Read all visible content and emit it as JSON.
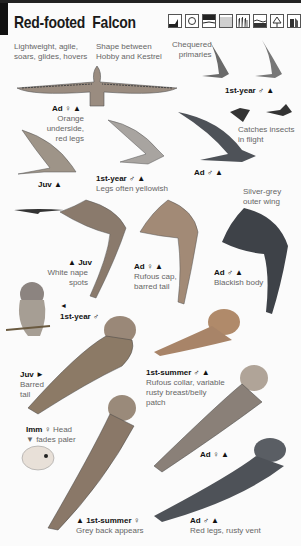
{
  "page": {
    "title": "Red-footed  Falcon",
    "habitat_icons": [
      {
        "name": "coast-icon"
      },
      {
        "name": "scrub-icon"
      },
      {
        "name": "marsh-icon"
      },
      {
        "name": "farmland-icon"
      },
      {
        "name": "reedbed-icon"
      },
      {
        "name": "water-icon"
      },
      {
        "name": "woodland-icon"
      },
      {
        "name": "urban-icon"
      }
    ]
  },
  "annotations": {
    "flight_note": "Lightweight, agile,\nsoars, glides, hovers",
    "shape_note": "Shape between\nHobby and Kestrel",
    "primaries_note": "Chequered\nprimaries",
    "first_year_male_top": "1st-year ♂ ▲",
    "ad_female_top": "Ad ♀ ▲",
    "ad_female_top_note": "Orange underside,\nred legs",
    "catches_note": "Catches insects\nin flight",
    "ad_male_flight": "Ad ♂ ▲",
    "juv_flight": "Juv ▲",
    "first_year_male_flight": "1st-year ♂ ▲",
    "first_year_male_flight_note": "Legs often yellowish",
    "silver_note": "Silver-grey\nouter wing",
    "juv_underwing": "▲ Juv",
    "juv_underwing_note": "White nape\nspots",
    "ad_female_under": "Ad ♀ ▲",
    "ad_female_under_note": "Rufous cap,\nbarred tail",
    "ad_male_under": "Ad ♂ ▲",
    "ad_male_under_note": "Blackish body",
    "first_year_male_perched_arrow": "◄",
    "first_year_male_perched": "1st-year ♂",
    "juv_perched": "Juv ►",
    "juv_perched_note": "Barred\ntail",
    "first_summer_male": "1st-summer ♂ ▲",
    "first_summer_male_note": "Rufous collar, variable\nrusty breast/belly\npatch",
    "imm_female": "Imm ♀",
    "imm_female_note_a": "Head",
    "imm_female_note_b": "▼ fades paler",
    "ad_female_perched": "Ad ♀ ▲",
    "first_summer_female": "▲ 1st-summer ♀",
    "first_summer_female_note": "Grey back appears",
    "ad_male_perched": "Ad ♂ ▲",
    "ad_male_perched_note": "Red legs, rusty vent"
  },
  "colors": {
    "ink": "#111111",
    "note": "#666666",
    "male_grey": "#4a4e55",
    "female_orange": "#b07a52",
    "juv_brown": "#7a6a5a"
  }
}
